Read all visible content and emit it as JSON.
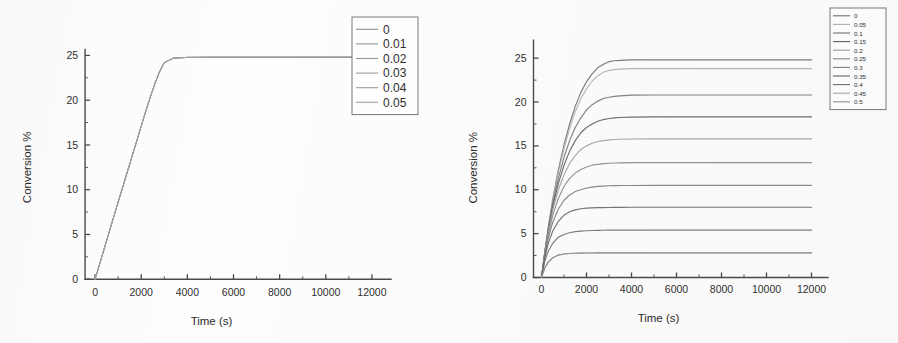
{
  "figure": {
    "background_color": "#fdfdfd",
    "axis_color": "#4a4a4a",
    "panel_count": 2
  },
  "chart_data": [
    {
      "type": "line",
      "panel": "left",
      "title": "",
      "xlabel": "Time (s)",
      "ylabel": "Conversion %",
      "xlim": [
        -1000,
        13000
      ],
      "ylim": [
        -1.2,
        26.5
      ],
      "xticks": [
        0,
        2000,
        4000,
        6000,
        8000,
        10000,
        12000
      ],
      "xticklabels": [
        "0",
        "2000",
        "4000",
        "6000",
        "8000",
        "10000",
        "12000"
      ],
      "yticks": [
        0,
        5,
        10,
        15,
        20,
        25
      ],
      "yticklabels": [
        "0",
        "5",
        "10",
        "15",
        "20",
        "25"
      ],
      "minor_ticks": true,
      "grid": false,
      "legend_position": "top-right",
      "legend_title": "",
      "x": [
        0,
        200,
        400,
        600,
        800,
        1000,
        1200,
        1400,
        1600,
        1800,
        2000,
        2200,
        2400,
        2600,
        2800,
        3000,
        3400,
        4000,
        5000,
        6000,
        8000,
        10000,
        12000
      ],
      "series": [
        {
          "name": "0",
          "color": "#8d8d8d",
          "plateau": 24.8,
          "values": [
            0,
            1.72,
            3.45,
            5.18,
            6.9,
            8.62,
            10.3,
            12.0,
            13.7,
            15.4,
            17.1,
            18.8,
            20.4,
            21.9,
            23.2,
            24.2,
            24.7,
            24.78,
            24.8,
            24.8,
            24.8,
            24.8,
            24.8
          ]
        },
        {
          "name": "0.01",
          "color": "#919191",
          "plateau": 24.8,
          "values": [
            0,
            1.72,
            3.45,
            5.18,
            6.9,
            8.62,
            10.3,
            12.0,
            13.7,
            15.4,
            17.1,
            18.8,
            20.4,
            21.9,
            23.2,
            24.2,
            24.7,
            24.78,
            24.8,
            24.8,
            24.8,
            24.8,
            24.8
          ]
        },
        {
          "name": "0.02",
          "color": "#959595",
          "plateau": 24.8,
          "values": [
            0,
            1.72,
            3.45,
            5.18,
            6.9,
            8.62,
            10.3,
            12.0,
            13.7,
            15.4,
            17.1,
            18.8,
            20.4,
            21.9,
            23.2,
            24.2,
            24.7,
            24.78,
            24.8,
            24.8,
            24.8,
            24.8,
            24.8
          ]
        },
        {
          "name": "0.03",
          "color": "#999999",
          "plateau": 24.8,
          "values": [
            0,
            1.72,
            3.45,
            5.18,
            6.9,
            8.62,
            10.3,
            12.0,
            13.7,
            15.4,
            17.1,
            18.8,
            20.4,
            21.9,
            23.2,
            24.2,
            24.7,
            24.78,
            24.8,
            24.8,
            24.8,
            24.8,
            24.8
          ]
        },
        {
          "name": "0.04",
          "color": "#9d9d9d",
          "plateau": 24.8,
          "values": [
            0,
            1.72,
            3.45,
            5.18,
            6.9,
            8.62,
            10.3,
            12.0,
            13.7,
            15.4,
            17.1,
            18.8,
            20.4,
            21.9,
            23.2,
            24.2,
            24.7,
            24.78,
            24.8,
            24.8,
            24.8,
            24.8,
            24.8
          ]
        },
        {
          "name": "0.05",
          "color": "#a1a1a1",
          "plateau": 24.8,
          "values": [
            0,
            1.72,
            3.45,
            5.18,
            6.9,
            8.62,
            10.3,
            12.0,
            13.7,
            15.4,
            17.1,
            18.8,
            20.4,
            21.9,
            23.2,
            24.2,
            24.7,
            24.78,
            24.8,
            24.8,
            24.8,
            24.8,
            24.8
          ]
        }
      ]
    },
    {
      "type": "line",
      "panel": "right",
      "title": "",
      "xlabel": "Time (s)",
      "ylabel": "Conversion %",
      "xlim": [
        -1000,
        13000
      ],
      "ylim": [
        -1.2,
        26.5
      ],
      "xticks": [
        0,
        2000,
        4000,
        6000,
        8000,
        10000,
        12000
      ],
      "xticklabels": [
        "0",
        "2000",
        "4000",
        "6000",
        "8000",
        "10000",
        "12000"
      ],
      "yticks": [
        0,
        5,
        10,
        15,
        20,
        25
      ],
      "yticklabels": [
        "0",
        "5",
        "10",
        "15",
        "20",
        "25"
      ],
      "minor_ticks": true,
      "grid": false,
      "legend_position": "top-right",
      "legend_title": "",
      "x": [
        0,
        150,
        300,
        500,
        750,
        1000,
        1250,
        1500,
        1750,
        2000,
        2250,
        2500,
        2750,
        3000,
        3250,
        3500,
        4000,
        5000,
        6000,
        7000,
        8000,
        9000,
        10000,
        11000,
        12000
      ],
      "series": [
        {
          "name": "0",
          "color": "#6f6f6f",
          "plateau": 24.8,
          "tau": 1150,
          "values": [
            0,
            3.0,
            5.7,
            8.9,
            12.3,
            15.1,
            17.5,
            19.5,
            21.1,
            22.3,
            23.2,
            23.9,
            24.3,
            24.6,
            24.7,
            24.75,
            24.8,
            24.8,
            24.8,
            24.8,
            24.8,
            24.8,
            24.8,
            24.8,
            24.8
          ]
        },
        {
          "name": "0.05",
          "color": "#b0b0b0",
          "plateau": 23.8,
          "tau": 1100,
          "values": [
            0,
            2.9,
            5.6,
            8.7,
            12.0,
            14.7,
            17.0,
            18.9,
            20.4,
            21.5,
            22.4,
            23.0,
            23.4,
            23.6,
            23.7,
            23.75,
            23.8,
            23.8,
            23.8,
            23.8,
            23.8,
            23.8,
            23.8,
            23.8,
            23.8
          ]
        },
        {
          "name": "0.1",
          "color": "#757575",
          "plateau": 20.8,
          "tau": 900,
          "values": [
            0,
            2.9,
            5.5,
            8.4,
            11.3,
            13.7,
            15.6,
            17.1,
            18.2,
            19.1,
            19.7,
            20.1,
            20.4,
            20.55,
            20.65,
            20.7,
            20.78,
            20.8,
            20.8,
            20.8,
            20.8,
            20.8,
            20.8,
            20.8,
            20.8
          ]
        },
        {
          "name": "0.15",
          "color": "#5f5f5f",
          "plateau": 18.3,
          "tau": 780,
          "values": [
            0,
            2.9,
            5.4,
            8.1,
            10.7,
            12.8,
            14.4,
            15.6,
            16.5,
            17.1,
            17.5,
            17.8,
            18.0,
            18.12,
            18.2,
            18.24,
            18.28,
            18.3,
            18.3,
            18.3,
            18.3,
            18.3,
            18.3,
            18.3,
            18.3
          ]
        },
        {
          "name": "0.2",
          "color": "#9e9e9e",
          "plateau": 15.8,
          "tau": 660,
          "values": [
            0,
            2.8,
            5.2,
            7.7,
            10.0,
            11.7,
            13.0,
            13.9,
            14.6,
            15.0,
            15.3,
            15.5,
            15.6,
            15.68,
            15.73,
            15.76,
            15.79,
            15.8,
            15.8,
            15.8,
            15.8,
            15.8,
            15.8,
            15.8,
            15.8
          ]
        },
        {
          "name": "0.25",
          "color": "#8a8a8a",
          "plateau": 13.1,
          "tau": 560,
          "values": [
            0,
            2.7,
            4.9,
            7.1,
            9.0,
            10.4,
            11.3,
            11.9,
            12.3,
            12.6,
            12.8,
            12.9,
            12.98,
            13.02,
            13.05,
            13.07,
            13.09,
            13.1,
            13.1,
            13.1,
            13.1,
            13.1,
            13.1,
            13.1,
            13.1
          ]
        },
        {
          "name": "0.3",
          "color": "#7d7d7d",
          "plateau": 10.5,
          "tau": 470,
          "values": [
            0,
            2.6,
            4.5,
            6.3,
            7.8,
            8.8,
            9.4,
            9.8,
            10.0,
            10.2,
            10.3,
            10.38,
            10.42,
            10.45,
            10.47,
            10.48,
            10.49,
            10.5,
            10.5,
            10.5,
            10.5,
            10.5,
            10.5,
            10.5,
            10.5
          ]
        },
        {
          "name": "0.35",
          "color": "#666666",
          "plateau": 8.0,
          "tau": 400,
          "values": [
            0,
            2.3,
            3.9,
            5.3,
            6.4,
            7.1,
            7.5,
            7.7,
            7.84,
            7.9,
            7.94,
            7.96,
            7.97,
            7.98,
            7.99,
            7.99,
            8.0,
            8.0,
            8.0,
            8.0,
            8.0,
            8.0,
            8.0,
            8.0,
            8.0
          ]
        },
        {
          "name": "0.4",
          "color": "#707070",
          "plateau": 5.4,
          "tau": 330,
          "values": [
            0,
            1.9,
            3.0,
            3.9,
            4.6,
            4.9,
            5.1,
            5.22,
            5.28,
            5.32,
            5.35,
            5.37,
            5.38,
            5.39,
            5.39,
            5.4,
            5.4,
            5.4,
            5.4,
            5.4,
            5.4,
            5.4,
            5.4,
            5.4,
            5.4
          ]
        },
        {
          "name": "0.45",
          "color": "#a8a8a8",
          "plateau": 2.8,
          "tau": 290,
          "values": [
            0,
            1.1,
            1.75,
            2.25,
            2.55,
            2.67,
            2.73,
            2.76,
            2.78,
            2.79,
            2.79,
            2.8,
            2.8,
            2.8,
            2.8,
            2.8,
            2.8,
            2.8,
            2.8,
            2.8,
            2.8,
            2.8,
            2.8,
            2.8,
            2.8
          ]
        },
        {
          "name": "0.5",
          "color": "#8f8f8f",
          "plateau": 2.8,
          "tau": 290,
          "values": [
            0,
            1.1,
            1.75,
            2.25,
            2.55,
            2.67,
            2.73,
            2.76,
            2.78,
            2.79,
            2.79,
            2.8,
            2.8,
            2.8,
            2.8,
            2.8,
            2.8,
            2.8,
            2.8,
            2.8,
            2.8,
            2.8,
            2.8,
            2.8,
            2.8
          ]
        }
      ]
    }
  ]
}
